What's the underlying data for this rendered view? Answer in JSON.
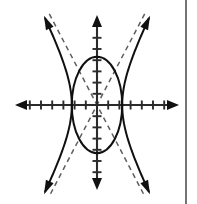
{
  "figure": {
    "background_color": "#ffffff",
    "ink_color": "#101010",
    "axis_color": "#2b2b2b",
    "asymptote_color": "#5e5e5e",
    "border_color": "#3a3a3a",
    "width": 197,
    "height": 204
  },
  "chart_data": {
    "type": "scatter",
    "subtitle": "",
    "xlabel": "",
    "ylabel": "",
    "grid": false,
    "legend": "none",
    "annotations": [],
    "axes": {
      "origin_px": {
        "x": 97,
        "y": 105
      },
      "unit_px": 11.2,
      "xlim": [
        -7.3,
        7.3
      ],
      "ylim": [
        -8.3,
        8.3
      ],
      "x_ticks": [
        -6,
        -5,
        -4,
        -3,
        -2,
        -1,
        1,
        2,
        3,
        4,
        5,
        6
      ],
      "y_ticks": [
        -6,
        -5,
        -4,
        -3,
        -2,
        -1,
        1,
        2,
        3,
        4,
        5,
        6
      ],
      "x_tick_labels": [],
      "y_tick_labels": [],
      "tick_length_px": 9,
      "x_axis_arrows": "both",
      "y_axis_arrows": "both"
    },
    "series": [
      {
        "name": "ellipse",
        "kind": "ellipse",
        "style": "solid",
        "center": [
          0,
          0
        ],
        "semi_axis_x": 2.25,
        "semi_axis_y": 4.3,
        "equation": "x^2/2.25^2 + y^2/4.3^2 = 1",
        "x_intercepts": [
          -2.25,
          2.25
        ],
        "y_intercepts": [
          -4.3,
          4.3
        ]
      },
      {
        "name": "hyperbola",
        "kind": "hyperbola",
        "style": "solid",
        "opens": "left-right",
        "center": [
          0,
          0
        ],
        "a": 2.25,
        "b": 4.3,
        "equation": "x^2/2.25^2 - y^2/4.3^2 = 1",
        "vertices": [
          [
            -2.25,
            0
          ],
          [
            2.25,
            0
          ]
        ],
        "branch_arrows": 4
      },
      {
        "name": "asymptotes",
        "kind": "lines",
        "style": "dashed",
        "through": [
          0,
          0
        ],
        "slopes": [
          1.911,
          -1.911
        ],
        "equations": [
          "y = 1.911x",
          "y = -1.911x"
        ]
      }
    ]
  },
  "border": {
    "right_rule_visible": true,
    "right_rule_x": 186
  }
}
